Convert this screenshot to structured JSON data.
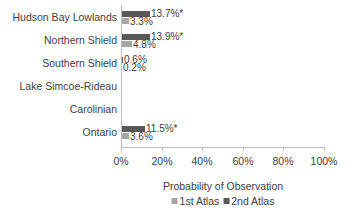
{
  "chart_data": {
    "type": "bar",
    "orientation": "horizontal",
    "title": "",
    "xlabel": "Probability of Observation",
    "ylabel": "",
    "xlim": [
      0,
      100
    ],
    "x_ticks": [
      "0%",
      "20%",
      "40%",
      "60%",
      "80%",
      "100%"
    ],
    "categories": [
      "Hudson Bay Lowlands",
      "Northern Shield",
      "Southern Shield",
      "Lake Simcoe-Rideau",
      "Carolinian",
      "Ontario"
    ],
    "series": [
      {
        "name": "1st Atlas",
        "color": "#a6a6a6",
        "values": [
          3.3,
          4.8,
          0.2,
          0,
          0,
          3.6
        ],
        "labels": [
          "3.3%",
          "4.8%",
          "0.2%",
          "",
          "",
          "3.6%"
        ]
      },
      {
        "name": "2nd Atlas",
        "color": "#595959",
        "values": [
          13.7,
          13.9,
          0.6,
          0,
          0,
          11.5
        ],
        "labels": [
          "13.7%*",
          "13.9%*",
          "0.6%",
          "",
          "",
          "11.5%*"
        ]
      }
    ],
    "legend_position": "bottom",
    "grid": false
  },
  "legend": {
    "s1": "1st Atlas",
    "s2": "2nd Atlas"
  }
}
